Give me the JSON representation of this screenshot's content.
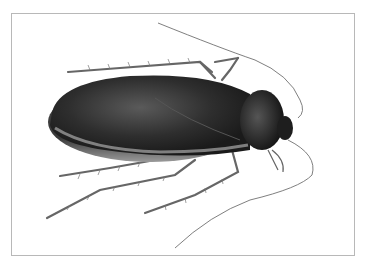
{
  "image": {
    "subject": "cockroach illustration",
    "frame_border_color": "#b8b8b8",
    "background_color": "#ffffff",
    "body_color": "#2a2a2a",
    "leg_color": "#6a6a6a"
  }
}
